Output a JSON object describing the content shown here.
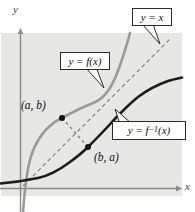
{
  "figure": {
    "axis_labels": {
      "x": "x",
      "y": "y"
    },
    "callouts": [
      {
        "id": "identity-line",
        "label": "y = x"
      },
      {
        "id": "function",
        "label": "y = f(x)"
      },
      {
        "id": "inverse-function",
        "pre": "y = f",
        "sup": "−1",
        "post": "(x)"
      }
    ],
    "points": [
      {
        "id": "point-on-f",
        "label": "(a, b)"
      },
      {
        "id": "point-on-f-inverse",
        "label": "(b, a)"
      }
    ],
    "colors": {
      "plot_bg": "#e7e7e5",
      "curve_f": "#9a9a9a",
      "curve_f_inverse": "#1c1c1c",
      "identity_line": "#7a7a7a",
      "reflection_segment": "#6f6f6f",
      "axis": "#8a8a8a",
      "callout_border": "#2b2b2b",
      "point_dot": "#111111"
    }
  }
}
